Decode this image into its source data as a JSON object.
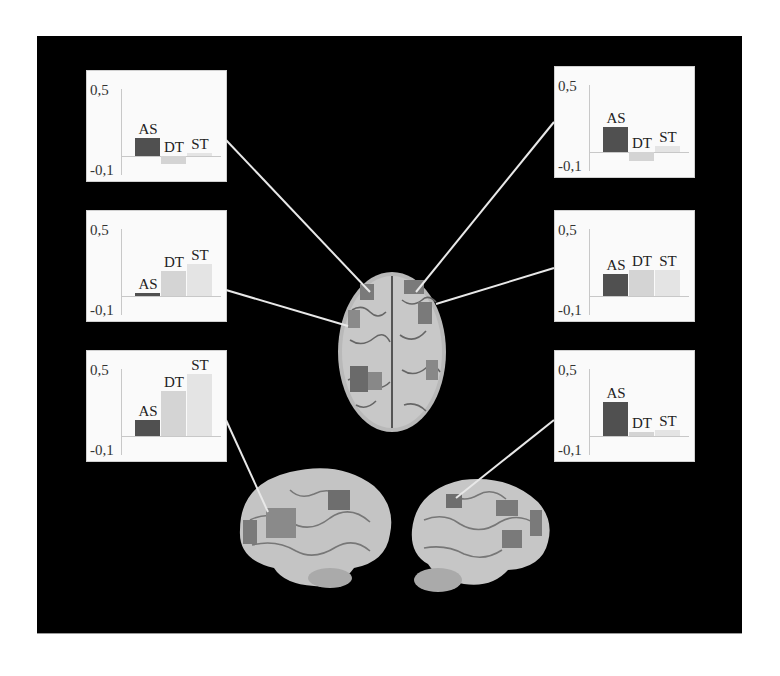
{
  "figure": {
    "background": "#000000",
    "panel_background": "#fafafa",
    "colors": {
      "AS": "#505050",
      "DT": "#d4d4d4",
      "ST": "#e4e4e4"
    },
    "axis": {
      "top_label": "0,5",
      "bottom_label": "-0,1"
    }
  },
  "chart_data": [
    {
      "type": "bar",
      "id": "left-top",
      "title": "",
      "categories": [
        "AS",
        "DT",
        "ST"
      ],
      "values": [
        0.14,
        -0.06,
        0.02
      ],
      "ytick_labels": [
        "0.5",
        "-0.1"
      ],
      "ylim": [
        -0.1,
        0.5
      ],
      "grid": false,
      "legend": "none (bar labels above bars)"
    },
    {
      "type": "bar",
      "id": "left-middle",
      "title": "",
      "categories": [
        "AS",
        "DT",
        "ST"
      ],
      "values": [
        0.02,
        0.19,
        0.25
      ],
      "ytick_labels": [
        "0.5",
        "-0.1"
      ],
      "ylim": [
        -0.1,
        0.5
      ],
      "grid": false,
      "legend": "none (bar labels above bars)"
    },
    {
      "type": "bar",
      "id": "left-bottom",
      "title": "",
      "categories": [
        "AS",
        "DT",
        "ST"
      ],
      "values": [
        0.12,
        0.35,
        0.48
      ],
      "ytick_labels": [
        "0.5",
        "-0,1"
      ],
      "ylim": [
        -0.1,
        0.5
      ],
      "grid": false,
      "legend": "none (bar labels above bars)"
    },
    {
      "type": "bar",
      "id": "right-top",
      "title": "",
      "categories": [
        "AS",
        "DT",
        "ST"
      ],
      "values": [
        0.19,
        -0.07,
        0.05
      ],
      "ytick_labels": [
        "0,5",
        "-0,1"
      ],
      "ylim": [
        -0.1,
        0.5
      ],
      "grid": false,
      "legend": "none (bar labels above bars)"
    },
    {
      "type": "bar",
      "id": "right-middle",
      "title": "",
      "categories": [
        "AS",
        "DT",
        "ST"
      ],
      "values": [
        0.17,
        0.2,
        0.2
      ],
      "ytick_labels": [
        "0,5",
        "-0.1"
      ],
      "ylim": [
        -0.1,
        0.5
      ],
      "grid": false,
      "legend": "none (bar labels above bars)"
    },
    {
      "type": "bar",
      "id": "right-bottom",
      "title": "",
      "categories": [
        "AS",
        "DT",
        "ST"
      ],
      "values": [
        0.26,
        0.03,
        0.05
      ],
      "ytick_labels": [
        "0,5",
        "-0.1"
      ],
      "ylim": [
        -0.1,
        0.5
      ],
      "grid": false,
      "legend": "none (bar labels above bars)"
    }
  ],
  "panels": [
    {
      "name": "left-top",
      "x": 86,
      "y": 70,
      "top_label": "0,5",
      "bottom_label": "-0,1"
    },
    {
      "name": "left-middle",
      "x": 86,
      "y": 210,
      "top_label": "0,5",
      "bottom_label": "-0,1"
    },
    {
      "name": "left-bottom",
      "x": 86,
      "y": 350,
      "top_label": "0,5",
      "bottom_label": "-0,1"
    },
    {
      "name": "right-top",
      "x": 554,
      "y": 66,
      "top_label": "0,5",
      "bottom_label": "-0,1"
    },
    {
      "name": "right-middle",
      "x": 554,
      "y": 210,
      "top_label": "0,5",
      "bottom_label": "-0,1"
    },
    {
      "name": "right-bottom",
      "x": 554,
      "y": 350,
      "top_label": "0,5",
      "bottom_label": "-0,1"
    }
  ],
  "images": [
    {
      "name": "brain-top-view",
      "description": "Dorsal view of brain with activation regions"
    },
    {
      "name": "brain-left-lateral-view",
      "description": "Left lateral brain view with activation regions"
    },
    {
      "name": "brain-right-lateral-view",
      "description": "Right lateral brain view with activation regions"
    }
  ]
}
